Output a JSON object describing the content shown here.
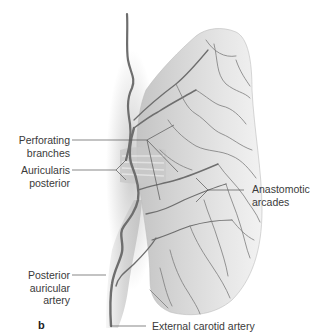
{
  "figure": {
    "panel_letter": "b",
    "labels": {
      "perforating_branches": [
        "Perforating",
        "branches"
      ],
      "auricularis_posterior": [
        "Auricularis",
        "posterior"
      ],
      "anastomotic_arcades": [
        "Anastomotic",
        "arcades"
      ],
      "posterior_auricular_artery": [
        "Posterior",
        "auricular artery"
      ],
      "external_carotid_artery": "External carotid artery"
    },
    "colors": {
      "leader_line": "#555555",
      "vessel": "#6e6e6e",
      "ear_fill": "#d9d9d9",
      "ear_shadow": "#b8b8b8"
    }
  }
}
